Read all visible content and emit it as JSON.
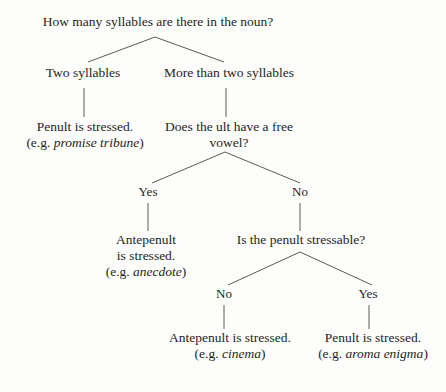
{
  "diagram": {
    "type": "decision-tree",
    "nodes": {
      "root": {
        "lines": [
          "How many syllables are there in the noun?"
        ]
      },
      "two_syllables": {
        "lines": [
          "Two syllables"
        ]
      },
      "more_than_two_syllables": {
        "lines": [
          "More than two syllables"
        ]
      },
      "penult_stressed_two": {
        "line1": "Penult is stressed.",
        "line2_prefix": "(e.g. ",
        "line2_example": "promise tribune",
        "line2_suffix": ")"
      },
      "free_vowel_question": {
        "line1": "Does the ult have a free",
        "line2": "vowel?"
      },
      "antepenult_stressed": {
        "line1": "Antepenult",
        "line2": "is stressed.",
        "line3_prefix": "(e.g. ",
        "line3_example": "anecdote",
        "line3_suffix": ")"
      },
      "penult_stressable_question": {
        "lines": [
          "Is the penult stressable?"
        ]
      },
      "antepenult_stressed_final": {
        "line1": "Antepenult is stressed.",
        "line2_prefix": "(e.g. ",
        "line2_example": "cinema",
        "line2_suffix": ")"
      },
      "penult_stressed_final": {
        "line1": "Penult is stressed.",
        "line2_prefix": "(e.g. ",
        "line2_example": "aroma enigma",
        "line2_suffix": ")"
      }
    },
    "branch_labels": {
      "free_vowel_yes": "Yes",
      "free_vowel_no": "No",
      "stressable_no": "No",
      "stressable_yes": "Yes"
    },
    "colors": {
      "background": "#fdfdfb",
      "text": "#1f1f1f",
      "line": "#5a5a5a"
    }
  }
}
